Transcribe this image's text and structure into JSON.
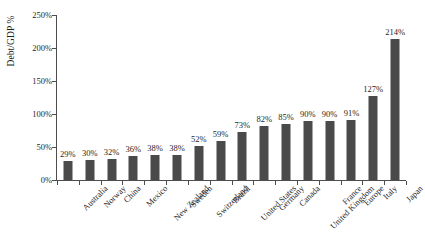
{
  "chart_data": {
    "type": "bar",
    "title": "",
    "subtitle": "",
    "xlabel": "",
    "ylabel": "Debt/GDP %",
    "ylim": [
      0,
      250
    ],
    "yticks": [
      0,
      50,
      100,
      150,
      200,
      250
    ],
    "ytick_labels": [
      "0%",
      "50%",
      "100%",
      "150%",
      "200%",
      "250%"
    ],
    "grid": false,
    "legend": null,
    "value_label_suffix": "%",
    "bar_color": "#4a4a4a",
    "axis_color": "#4d4d4d",
    "categories": [
      "Australia",
      "Norway",
      "China",
      "Mexico",
      "New Zealand",
      "Sweden",
      "Switzerland",
      "Brazil",
      "United States",
      "Germany",
      "Canada",
      "United Kingdom",
      "France",
      "Europe",
      "Italy",
      "Japan"
    ],
    "values": [
      29,
      30,
      32,
      36,
      38,
      38,
      52,
      59,
      73,
      82,
      85,
      90,
      90,
      91,
      127,
      214
    ],
    "value_labels": [
      "29%",
      "30%",
      "32%",
      "36%",
      "38%",
      "38%",
      "52%",
      "59%",
      "73%",
      "82%",
      "85%",
      "90%",
      "90%",
      "91%",
      "127%",
      "214%"
    ]
  }
}
